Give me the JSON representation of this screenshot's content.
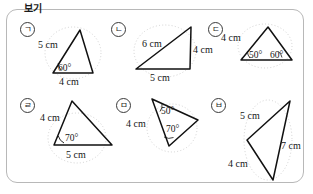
{
  "panel": {
    "caption": "보기",
    "border_color": "#b8b8b8",
    "background": "#ffffff"
  },
  "figure_type": "geometry-triangle-set",
  "stroke_color": "#111111",
  "guide_color": "#c9c9c9",
  "items": [
    {
      "marker": "ㄱ",
      "name": "triangle-a",
      "labels": [
        {
          "text": "5 cm",
          "kind": "length"
        },
        {
          "text": "60°",
          "kind": "angle"
        },
        {
          "text": "4 cm",
          "kind": "length"
        }
      ]
    },
    {
      "marker": "ㄴ",
      "name": "triangle-b",
      "labels": [
        {
          "text": "6 cm",
          "kind": "length"
        },
        {
          "text": "4 cm",
          "kind": "length"
        },
        {
          "text": "5 cm",
          "kind": "length"
        }
      ]
    },
    {
      "marker": "ㄷ",
      "name": "triangle-c",
      "labels": [
        {
          "text": "4 cm",
          "kind": "length"
        },
        {
          "text": "50°",
          "kind": "angle"
        },
        {
          "text": "60°",
          "kind": "angle"
        }
      ]
    },
    {
      "marker": "ㄹ",
      "name": "triangle-d",
      "labels": [
        {
          "text": "4 cm",
          "kind": "length"
        },
        {
          "text": "70°",
          "kind": "angle"
        },
        {
          "text": "5 cm",
          "kind": "length"
        }
      ]
    },
    {
      "marker": "ㅁ",
      "name": "triangle-e",
      "labels": [
        {
          "text": "4 cm",
          "kind": "length"
        },
        {
          "text": "50°",
          "kind": "angle"
        },
        {
          "text": "70°",
          "kind": "angle"
        }
      ]
    },
    {
      "marker": "ㅂ",
      "name": "triangle-f",
      "labels": [
        {
          "text": "5 cm",
          "kind": "length"
        },
        {
          "text": "7 cm",
          "kind": "length"
        },
        {
          "text": "4 cm",
          "kind": "length"
        }
      ]
    }
  ]
}
